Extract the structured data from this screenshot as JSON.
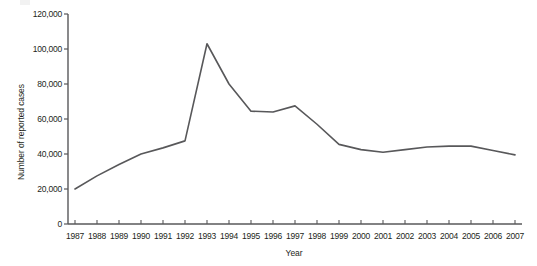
{
  "chart_data": {
    "type": "line",
    "title": "",
    "subtitle": "",
    "xlabel": "Year",
    "ylabel": "Number of reported cases",
    "grid": false,
    "legend": null,
    "legend_position": "none",
    "xlim": [
      1987,
      2007
    ],
    "ylim": [
      0,
      120000
    ],
    "ytick_labels": [
      "120,000",
      "100,000",
      "80,000",
      "60,000",
      "40,000",
      "20,000",
      "0"
    ],
    "ytick_values": [
      120000,
      100000,
      80000,
      60000,
      40000,
      20000,
      0
    ],
    "categories": [
      "1987",
      "1988",
      "1989",
      "1990",
      "1991",
      "1992",
      "1993",
      "1994",
      "1995",
      "1996",
      "1997",
      "1998",
      "1999",
      "2000",
      "2001",
      "2002",
      "2003",
      "2004",
      "2005",
      "2006",
      "2007"
    ],
    "x": [
      1987,
      1988,
      1989,
      1990,
      1991,
      1992,
      1993,
      1994,
      1995,
      1996,
      1997,
      1998,
      1999,
      2000,
      2001,
      2002,
      2003,
      2004,
      2005,
      2006,
      2007
    ],
    "values": [
      20000,
      27500,
      34000,
      40000,
      43500,
      47500,
      103000,
      80000,
      64500,
      64000,
      67500,
      57000,
      45500,
      42500,
      41000,
      42500,
      44000,
      44500,
      44500,
      42000,
      39500
    ],
    "series": [
      {
        "name": "Number of reported cases",
        "color": "#58585a",
        "values": [
          20000,
          27500,
          34000,
          40000,
          43500,
          47500,
          103000,
          80000,
          64500,
          64000,
          67500,
          57000,
          45500,
          42500,
          41000,
          42500,
          44000,
          44500,
          44500,
          42000,
          39500
        ]
      }
    ],
    "colors": {
      "line": "#58585a",
      "axis": "#58585a",
      "text": "#231f20",
      "background": "#ffffff"
    }
  }
}
